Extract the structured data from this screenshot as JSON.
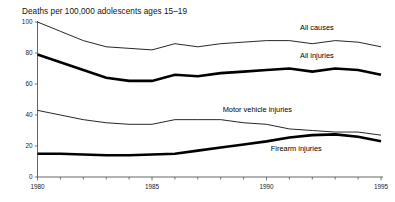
{
  "chart_data": {
    "type": "line",
    "title": "Deaths per 100,000 adolescents ages 15–19",
    "xlabel": "",
    "ylabel": "",
    "xlim": [
      1980,
      1995
    ],
    "ylim": [
      0,
      100
    ],
    "grid": false,
    "legend_position": "inline-labels",
    "y_ticks": [
      "0",
      "20",
      "40",
      "60",
      "80",
      "100"
    ],
    "y_tick_values": [
      0,
      20,
      40,
      60,
      80,
      100
    ],
    "x_ticks": [
      "1980",
      "1985",
      "1990",
      "1995"
    ],
    "x_tick_values": [
      1980,
      1985,
      1990,
      1995
    ],
    "x_minor_tick_values": [
      1981,
      1982,
      1983,
      1984,
      1986,
      1987,
      1988,
      1989,
      1991,
      1992,
      1993,
      1994
    ],
    "x": [
      1980,
      1981,
      1982,
      1983,
      1984,
      1985,
      1986,
      1987,
      1988,
      1989,
      1990,
      1991,
      1992,
      1993,
      1994,
      1995
    ],
    "series": [
      {
        "name": "All causes",
        "label": "All causes",
        "style": "thin",
        "color": "#000000",
        "values": [
          100.0,
          94.0,
          88.0,
          84.0,
          83.0,
          82.0,
          86.0,
          84.0,
          86.0,
          87.0,
          88.0,
          88.0,
          86.0,
          88.0,
          87.0,
          84.0
        ]
      },
      {
        "name": "All injuries",
        "label": "All injuries",
        "style": "thick",
        "color": "#000000",
        "values": [
          79.0,
          74.0,
          69.0,
          64.0,
          62.0,
          62.0,
          66.0,
          65.0,
          67.0,
          68.0,
          69.0,
          70.0,
          68.0,
          70.0,
          69.0,
          66.0
        ]
      },
      {
        "name": "Motor vehicle injuries",
        "label": "Motor vehicle injuries",
        "style": "thin",
        "color": "#000000",
        "values": [
          43.0,
          40.0,
          37.0,
          35.0,
          34.0,
          34.0,
          37.0,
          37.0,
          37.0,
          35.0,
          34.0,
          31.0,
          30.0,
          29.0,
          29.0,
          27.0
        ]
      },
      {
        "name": "Firearm injuries",
        "label": "Firearm injuries",
        "style": "thick",
        "color": "#000000",
        "values": [
          15.0,
          15.0,
          14.5,
          14.0,
          14.0,
          14.5,
          15.0,
          17.0,
          19.0,
          21.0,
          23.0,
          25.5,
          27.0,
          27.5,
          26.0,
          23.0
        ]
      }
    ],
    "annotations": [
      {
        "text": "All causes",
        "x": 1992.2,
        "y": 95.0
      },
      {
        "text": "All injuries",
        "x": 1992.2,
        "y": 77.0
      },
      {
        "text": "Motor vehicle injuries",
        "x": 1989.6,
        "y": 42.0
      },
      {
        "text": "Firearm injuries",
        "x": 1991.3,
        "y": 16.5
      }
    ]
  }
}
